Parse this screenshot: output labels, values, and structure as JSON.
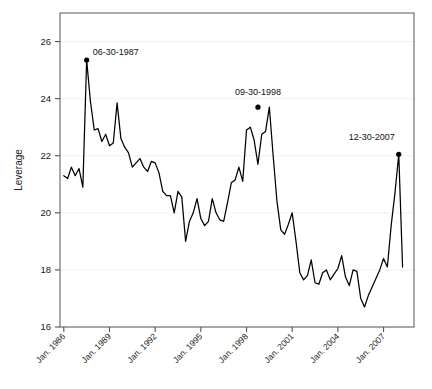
{
  "chart_data": {
    "type": "line",
    "title": "",
    "xlabel": "",
    "ylabel": "Leverage",
    "ylim": [
      16,
      27
    ],
    "xlim": [
      1985.75,
      2009.0
    ],
    "grid": true,
    "legend": null,
    "yticks": [
      16,
      18,
      20,
      22,
      24,
      26
    ],
    "ytick_labels": [
      "16",
      "18",
      "20",
      "22",
      "24",
      "26"
    ],
    "xticks": [
      1986,
      1989,
      1992,
      1995,
      1998,
      2001,
      2004,
      2007
    ],
    "xtick_labels": [
      "Jan. 1986",
      "Jan. 1989",
      "Jan. 1992",
      "Jan. 1995",
      "Jan. 1998",
      "Jan. 2001",
      "Jan. 2004",
      "Jan. 2007"
    ],
    "line_color": "#000000",
    "annotations": [
      {
        "label": "06-30-1987",
        "x": 1987.5,
        "y": 25.35,
        "marker": true
      },
      {
        "label": "09-30-1998",
        "x": 1998.75,
        "y": 23.7,
        "marker": true
      },
      {
        "label": "12-30-2007",
        "x": 2008.0,
        "y": 22.05,
        "marker": true
      }
    ],
    "x": [
      1986.0,
      1986.25,
      1986.5,
      1986.75,
      1987.0,
      1987.25,
      1987.5,
      1987.75,
      1988.0,
      1988.25,
      1988.5,
      1988.75,
      1989.0,
      1989.25,
      1989.5,
      1989.75,
      1990.0,
      1990.25,
      1990.5,
      1990.75,
      1991.0,
      1991.25,
      1991.5,
      1991.75,
      1992.0,
      1992.25,
      1992.5,
      1992.75,
      1993.0,
      1993.25,
      1993.5,
      1993.75,
      1994.0,
      1994.25,
      1994.5,
      1994.75,
      1995.0,
      1995.25,
      1995.5,
      1995.75,
      1996.0,
      1996.25,
      1996.5,
      1996.75,
      1997.0,
      1997.25,
      1997.5,
      1997.75,
      1998.0,
      1998.25,
      1998.5,
      1998.75,
      1999.0,
      1999.25,
      1999.5,
      1999.75,
      2000.0,
      2000.25,
      2000.5,
      2000.75,
      2001.0,
      2001.25,
      2001.5,
      2001.75,
      2002.0,
      2002.25,
      2002.5,
      2002.75,
      2003.0,
      2003.25,
      2003.5,
      2003.75,
      2004.0,
      2004.25,
      2004.5,
      2004.75,
      2005.0,
      2005.25,
      2005.5,
      2005.75,
      2006.0,
      2006.25,
      2006.5,
      2006.75,
      2007.0,
      2007.25,
      2007.5,
      2007.75,
      2008.0,
      2008.25
    ],
    "values": [
      21.3,
      21.2,
      21.6,
      21.3,
      21.55,
      20.9,
      25.35,
      23.9,
      22.9,
      22.95,
      22.5,
      22.75,
      22.35,
      22.45,
      23.85,
      22.6,
      22.3,
      22.1,
      21.6,
      21.75,
      21.9,
      21.6,
      21.45,
      21.8,
      21.75,
      21.4,
      20.75,
      20.6,
      20.6,
      20.0,
      20.75,
      20.55,
      19.0,
      19.7,
      20.0,
      20.5,
      19.8,
      19.55,
      19.7,
      20.5,
      20.0,
      19.75,
      19.7,
      20.35,
      21.05,
      21.15,
      21.6,
      21.1,
      22.9,
      23.0,
      22.55,
      21.7,
      22.75,
      22.85,
      23.7,
      22.0,
      20.4,
      19.4,
      19.25,
      19.6,
      20.0,
      19.0,
      17.9,
      17.65,
      17.8,
      18.35,
      17.55,
      17.5,
      17.9,
      18.0,
      17.65,
      17.85,
      18.05,
      18.5,
      17.75,
      17.45,
      18.0,
      17.95,
      17.0,
      16.7,
      17.1,
      17.4,
      17.7,
      18.0,
      18.4,
      18.1,
      19.55,
      20.7,
      22.05,
      18.1
    ]
  }
}
